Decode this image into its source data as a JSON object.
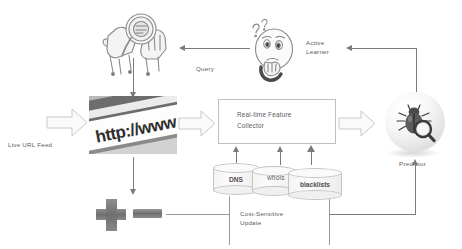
{
  "diagram": {
    "width": 462,
    "height": 249,
    "background_color": "#ffffff",
    "line_color": "#7b7b7d",
    "text_color": "#5b5b5d"
  },
  "nodes": {
    "live_url_feed": {
      "label": "Live URL Feed",
      "icon": "block-arrow-right-icon"
    },
    "url_photo": {
      "label": "http://www",
      "icon": "url-photo-icon",
      "description": "Photograph of a URL address bar reading http://www"
    },
    "human_labeler": {
      "label": "",
      "icon": "hands-magnifier-icon",
      "description": "Two hands inspecting with a magnifying glass (human labeling)"
    },
    "active_learner": {
      "label": "Active\nLearner",
      "icon": "thinking-face-icon",
      "description": "Face with question marks and hand on chin"
    },
    "collector": {
      "label": "Real-time Feature\nCollector"
    },
    "predictor": {
      "label": "Predictor",
      "icon": "bug-magnifier-sphere-icon",
      "description": "Glossy sphere containing a beetle and magnifying glass"
    },
    "training_data": {
      "plus_icon": "plus-icon",
      "minus_icon": "minus-icon",
      "description": "Positive and negative labeled training examples"
    }
  },
  "datasources": [
    {
      "label": "DNS",
      "style": "cylinder"
    },
    {
      "label": "whois",
      "style": "cylinder"
    },
    {
      "label": "blacklists",
      "style": "cylinder"
    }
  ],
  "edges": [
    {
      "label": "Query",
      "from": "active_learner",
      "to": "human_labeler",
      "direction": "left"
    },
    {
      "label": "Cost-Sensitive\nUpdate",
      "from": "predictor",
      "to": "training_data",
      "direction": "left"
    },
    {
      "label": "",
      "from": "live_url_feed",
      "to": "url_photo",
      "direction": "right"
    },
    {
      "label": "",
      "from": "url_photo",
      "to": "collector",
      "direction": "right"
    },
    {
      "label": "",
      "from": "collector",
      "to": "predictor",
      "direction": "right"
    },
    {
      "label": "",
      "from": "human_labeler",
      "to": "url_photo",
      "direction": "down"
    },
    {
      "label": "",
      "from": "url_photo",
      "to": "training_data",
      "direction": "down"
    },
    {
      "label": "",
      "from": "predictor",
      "to": "active_learner",
      "direction": "up-left"
    },
    {
      "label": "",
      "from": "training_data",
      "to": "predictor",
      "direction": "right-up"
    }
  ]
}
